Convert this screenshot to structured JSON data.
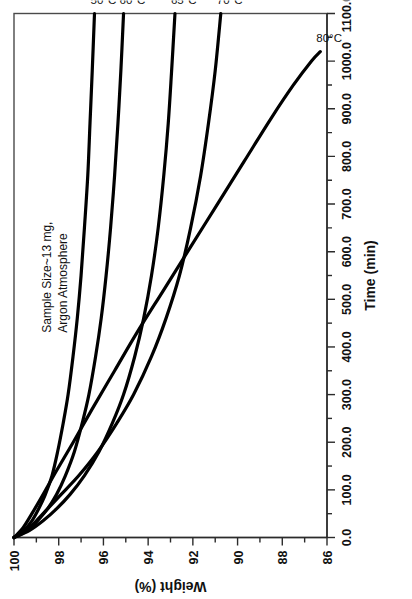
{
  "chart_data": {
    "type": "line",
    "title": "",
    "xlabel": "Time (min)",
    "ylabel": "Weight (%)",
    "xlim": [
      0.0,
      1100.0
    ],
    "ylim": [
      86,
      100
    ],
    "y_inverted": true,
    "grid": false,
    "legend_position": "inline-end-labels",
    "xticklabels": [
      "0.0",
      "100.0",
      "200.0",
      "300.0",
      "400.0",
      "500.0",
      "600.0",
      "700.0",
      "800.0",
      "900.0",
      "1000.0",
      "1100.0"
    ],
    "xtickvalues": [
      0,
      100,
      200,
      300,
      400,
      500,
      600,
      700,
      800,
      900,
      1000,
      1100
    ],
    "xminor_step": 50,
    "yticklabels": [
      "100",
      "98",
      "96",
      "94",
      "92",
      "90",
      "88",
      "86"
    ],
    "ytickvalues": [
      100,
      98,
      96,
      94,
      92,
      90,
      88,
      86
    ],
    "yminor_step": 1,
    "annotations": [
      "Sample Size~13 mg,",
      "Argon Atmosphere"
    ],
    "series": [
      {
        "name": "50°C",
        "label": "50°C",
        "color": "#000000",
        "points": [
          [
            0,
            100.0
          ],
          [
            15,
            99.55
          ],
          [
            35,
            99.2
          ],
          [
            60,
            98.9
          ],
          [
            90,
            98.6
          ],
          [
            130,
            98.3
          ],
          [
            180,
            98.05
          ],
          [
            240,
            97.8
          ],
          [
            300,
            97.58
          ],
          [
            380,
            97.36
          ],
          [
            460,
            97.17
          ],
          [
            550,
            97.0
          ],
          [
            650,
            96.85
          ],
          [
            760,
            96.7
          ],
          [
            870,
            96.6
          ],
          [
            980,
            96.5
          ],
          [
            1100,
            96.4
          ]
        ]
      },
      {
        "name": "60°C",
        "label": "60°C",
        "color": "#000000",
        "points": [
          [
            0,
            100.0
          ],
          [
            15,
            99.4
          ],
          [
            35,
            98.95
          ],
          [
            60,
            98.5
          ],
          [
            90,
            98.1
          ],
          [
            130,
            97.7
          ],
          [
            180,
            97.3
          ],
          [
            240,
            96.95
          ],
          [
            300,
            96.65
          ],
          [
            380,
            96.35
          ],
          [
            460,
            96.1
          ],
          [
            550,
            95.88
          ],
          [
            650,
            95.68
          ],
          [
            760,
            95.5
          ],
          [
            870,
            95.35
          ],
          [
            980,
            95.22
          ],
          [
            1100,
            95.1
          ]
        ]
      },
      {
        "name": "65°C",
        "label": "65°C",
        "color": "#000000",
        "points": [
          [
            0,
            100.0
          ],
          [
            15,
            99.3
          ],
          [
            35,
            98.7
          ],
          [
            60,
            98.1
          ],
          [
            90,
            97.5
          ],
          [
            130,
            96.85
          ],
          [
            180,
            96.2
          ],
          [
            240,
            95.6
          ],
          [
            300,
            95.1
          ],
          [
            380,
            94.6
          ],
          [
            460,
            94.2
          ],
          [
            550,
            93.85
          ],
          [
            650,
            93.55
          ],
          [
            760,
            93.3
          ],
          [
            870,
            93.1
          ],
          [
            980,
            92.95
          ],
          [
            1100,
            92.8
          ]
        ]
      },
      {
        "name": "70°C",
        "label": "70°C",
        "color": "#000000",
        "points": [
          [
            0,
            100.0
          ],
          [
            15,
            99.45
          ],
          [
            35,
            99.0
          ],
          [
            60,
            98.5
          ],
          [
            90,
            97.9
          ],
          [
            130,
            97.1
          ],
          [
            180,
            96.25
          ],
          [
            240,
            95.4
          ],
          [
            300,
            94.65
          ],
          [
            380,
            93.85
          ],
          [
            460,
            93.2
          ],
          [
            550,
            92.6
          ],
          [
            650,
            92.1
          ],
          [
            760,
            91.65
          ],
          [
            870,
            91.3
          ],
          [
            980,
            91.0
          ],
          [
            1100,
            90.75
          ]
        ]
      },
      {
        "name": "80°C",
        "label": "80°C",
        "color": "#000000",
        "points": [
          [
            0,
            100.0
          ],
          [
            20,
            99.6
          ],
          [
            50,
            99.2
          ],
          [
            90,
            98.7
          ],
          [
            140,
            98.1
          ],
          [
            200,
            97.35
          ],
          [
            270,
            96.5
          ],
          [
            350,
            95.5
          ],
          [
            430,
            94.5
          ],
          [
            520,
            93.3
          ],
          [
            610,
            92.1
          ],
          [
            700,
            90.9
          ],
          [
            790,
            89.7
          ],
          [
            880,
            88.5
          ],
          [
            950,
            87.5
          ],
          [
            1000,
            86.7
          ],
          [
            1020,
            86.3
          ]
        ]
      }
    ]
  },
  "labels": {
    "x_axis_title": "Time (min)",
    "y_axis_title": "Weight (%)",
    "note_line_1": "Sample Size~13 mg,",
    "note_line_2": "Argon Atmosphere",
    "series_50": "50°C",
    "series_60": "60°C",
    "series_65": "65°C",
    "series_70": "70°C",
    "series_80": "80°C"
  },
  "colors": {
    "curve": "#000000",
    "axis": "#2b2b2b",
    "frame": "#4a4a4a",
    "background": "#ffffff"
  }
}
